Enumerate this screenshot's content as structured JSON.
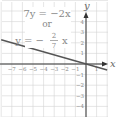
{
  "chart_data": {
    "type": "line",
    "title": "",
    "equation_lines": [
      "7y = −2x",
      "or",
      "y = −",
      "2",
      "7",
      "x"
    ],
    "equation_text": "7y = -2x or y = -(2/7)x",
    "xlabel": "x",
    "ylabel": "y",
    "x_ticks": [
      "-7",
      "-6",
      "-5",
      "-4",
      "-3",
      "-2",
      "-1",
      "1"
    ],
    "y_ticks": [
      "4",
      "3",
      "2",
      "1",
      "-1",
      "-2",
      "-3",
      "-4"
    ],
    "xlim": [
      -8,
      2
    ],
    "ylim": [
      -5,
      5.7
    ],
    "grid": true,
    "series": [
      {
        "name": "y = -(2/7)x",
        "slope": -0.2857,
        "intercept": 0,
        "x": [
          -8,
          2
        ],
        "y": [
          2.29,
          -0.57
        ]
      }
    ],
    "colors": {
      "grid": "#d4d4d4",
      "axis": "#333333",
      "line": "#555555",
      "label": "#888888"
    }
  }
}
